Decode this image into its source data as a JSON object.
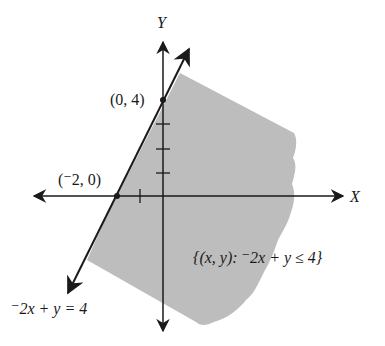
{
  "figure": {
    "type": "graph-of-linear-inequality",
    "axes": {
      "x_label": "X",
      "y_label": "Y"
    },
    "boundary_line": {
      "equation_label": "⁻2x + y = 4",
      "style": "solid"
    },
    "points": [
      {
        "label": "(0, 4)",
        "x": 0,
        "y": 4
      },
      {
        "label": "(⁻2, 0)",
        "x": -2,
        "y": 0
      }
    ],
    "region": {
      "label": "{(x, y):  ⁻2x + y ≤ 4}",
      "fill_color": "#bdbdbd",
      "side": "below-right of line"
    },
    "ticks": {
      "x": [
        -1
      ],
      "y": [
        1,
        2,
        3
      ]
    },
    "colors": {
      "ink": "#1a1a1a",
      "shade": "#bdbdbd",
      "background": "#ffffff"
    }
  }
}
